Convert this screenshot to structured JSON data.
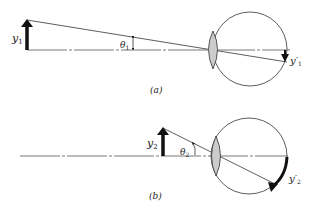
{
  "figure": {
    "panel_a": {
      "caption": "(a)",
      "object_label": "y",
      "object_sub": "1",
      "angle_label": "θ",
      "angle_sub": "1",
      "image_label": "y′",
      "image_sub": "1"
    },
    "panel_b": {
      "caption": "(b)",
      "object_label": "y",
      "object_sub": "2",
      "angle_label": "θ",
      "angle_sub": "2",
      "image_label": "y′",
      "image_sub": "2"
    },
    "colors": {
      "line": "#333333",
      "lens_fill": "#cccccc",
      "arrow": "#111111"
    }
  }
}
